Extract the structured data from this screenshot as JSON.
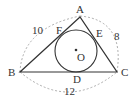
{
  "figure": {
    "type": "triangle-incircle",
    "colors": {
      "stroke": "#333333",
      "dashed": "#999999",
      "background": "#ffffff"
    },
    "vertices": [
      {
        "name": "A",
        "label": "A"
      },
      {
        "name": "B",
        "label": "B"
      },
      {
        "name": "C",
        "label": "C"
      }
    ],
    "tangent_points": [
      {
        "name": "D",
        "label": "D",
        "on_side": "BC"
      },
      {
        "name": "E",
        "label": "E",
        "on_side": "CA"
      },
      {
        "name": "F",
        "label": "F",
        "on_side": "AB"
      }
    ],
    "center": {
      "name": "O",
      "label": "O"
    },
    "side_lengths": [
      {
        "side": "AB",
        "label": "10"
      },
      {
        "side": "CA",
        "label": "8"
      },
      {
        "side": "BC",
        "label": "12"
      }
    ]
  }
}
